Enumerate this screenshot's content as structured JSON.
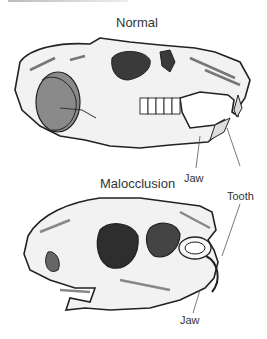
{
  "figure": {
    "title_top": "Normal",
    "title_bottom": "Malocclusion",
    "labels": {
      "jaw_top": "Jaw",
      "tooth": "Tooth",
      "jaw_bottom": "Jaw"
    },
    "colors": {
      "line": "#222222",
      "shade_dark": "#555555",
      "shade_mid": "#999999",
      "bone": "#f2f2f2",
      "text": "#333333"
    }
  }
}
